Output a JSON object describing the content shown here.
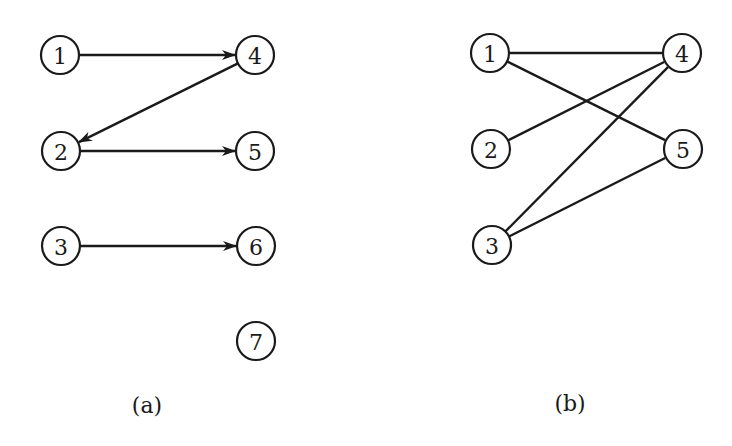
{
  "style": {
    "ink": "#1a1a1a",
    "background": "#ffffff",
    "node_radius": 19
  },
  "diagrams": [
    {
      "id": "a",
      "caption": "(a)",
      "caption_pos": [
        147,
        405
      ],
      "directed": true,
      "nodes": [
        {
          "id": "1",
          "label": "1",
          "x": 60,
          "y": 55
        },
        {
          "id": "2",
          "label": "2",
          "x": 61,
          "y": 151
        },
        {
          "id": "3",
          "label": "3",
          "x": 61,
          "y": 246
        },
        {
          "id": "4",
          "label": "4",
          "x": 255,
          "y": 55
        },
        {
          "id": "5",
          "label": "5",
          "x": 255,
          "y": 151
        },
        {
          "id": "6",
          "label": "6",
          "x": 256,
          "y": 246
        },
        {
          "id": "7",
          "label": "7",
          "x": 256,
          "y": 341
        }
      ],
      "edges": [
        {
          "from": "1",
          "to": "4"
        },
        {
          "from": "4",
          "to": "2"
        },
        {
          "from": "2",
          "to": "5"
        },
        {
          "from": "3",
          "to": "6"
        }
      ]
    },
    {
      "id": "b",
      "caption": "(b)",
      "caption_pos": [
        570,
        403
      ],
      "directed": false,
      "nodes": [
        {
          "id": "1",
          "label": "1",
          "x": 490,
          "y": 53
        },
        {
          "id": "2",
          "label": "2",
          "x": 491,
          "y": 149
        },
        {
          "id": "3",
          "label": "3",
          "x": 492,
          "y": 245
        },
        {
          "id": "4",
          "label": "4",
          "x": 682,
          "y": 53
        },
        {
          "id": "5",
          "label": "5",
          "x": 683,
          "y": 149
        }
      ],
      "edges": [
        {
          "from": "1",
          "to": "4"
        },
        {
          "from": "1",
          "to": "5"
        },
        {
          "from": "2",
          "to": "4"
        },
        {
          "from": "3",
          "to": "4"
        },
        {
          "from": "3",
          "to": "5"
        }
      ]
    }
  ]
}
